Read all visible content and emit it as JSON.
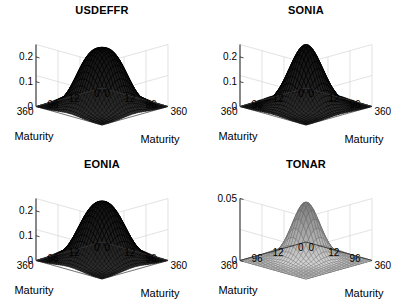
{
  "figure": {
    "layout": "2x2 grid of 3D surface plots",
    "panel_order": [
      "USDEFFR",
      "SONIA",
      "EONIA",
      "TONAR"
    ]
  },
  "chart_data": [
    {
      "type": "surface",
      "title": "USDEFFR",
      "xlabel": "Maturity",
      "ylabel": "Maturity",
      "zlabel": "",
      "grid": true,
      "legend": null,
      "x_ticks": [
        "0",
        "12",
        "96",
        "360"
      ],
      "y_ticks": [
        "360",
        "96",
        "12",
        "0"
      ],
      "z_ticks": [
        "0",
        "0.1",
        "0.2"
      ],
      "zlim": [
        0,
        0.25
      ],
      "peak_value": 0.23,
      "peak_x": 96,
      "peak_y": 96,
      "shape": "broad rounded dome plateau",
      "surface_color": "#1a1a1a",
      "mesh_color": "#000000"
    },
    {
      "type": "surface",
      "title": "SONIA",
      "xlabel": "Maturity",
      "ylabel": "Maturity",
      "zlabel": "",
      "grid": true,
      "legend": null,
      "x_ticks": [
        "0",
        "12",
        "96",
        "360"
      ],
      "y_ticks": [
        "360",
        "96",
        "12",
        "0"
      ],
      "z_ticks": [
        "0",
        "0.1",
        "0.2"
      ],
      "zlim": [
        0,
        0.25
      ],
      "peak_value": 0.24,
      "peak_x": 96,
      "peak_y": 96,
      "shape": "sharp central peak",
      "surface_color": "#151515",
      "mesh_color": "#000000"
    },
    {
      "type": "surface",
      "title": "EONIA",
      "xlabel": "Maturity",
      "ylabel": "Maturity",
      "zlabel": "",
      "grid": true,
      "legend": null,
      "x_ticks": [
        "0",
        "12",
        "96",
        "360"
      ],
      "y_ticks": [
        "360",
        "96",
        "12",
        "0"
      ],
      "z_ticks": [
        "0",
        "0.1",
        "0.2"
      ],
      "zlim": [
        0,
        0.25
      ],
      "peak_value": 0.23,
      "peak_x": 96,
      "peak_y": 96,
      "shape": "broad rounded dome",
      "surface_color": "#181818",
      "mesh_color": "#000000"
    },
    {
      "type": "surface",
      "title": "TONAR",
      "xlabel": "Maturity",
      "ylabel": "Maturity",
      "zlabel": "",
      "grid": true,
      "legend": null,
      "x_ticks": [
        "0",
        "12",
        "96",
        "360"
      ],
      "y_ticks": [
        "360",
        "96",
        "12",
        "0"
      ],
      "z_ticks": [
        "0",
        "0.05"
      ],
      "zlim": [
        0,
        0.055
      ],
      "peak_value": 0.042,
      "peak_x": 60,
      "peak_y": 60,
      "shape": "narrow smooth peak near short maturities",
      "surface_color": "#9a9a9a",
      "mesh_color": "#4a4a4a"
    }
  ]
}
